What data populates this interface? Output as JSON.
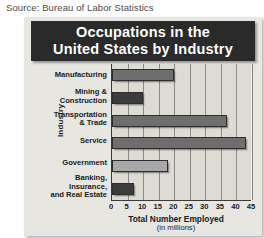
{
  "source_note": "Source: Bureau of Labor Statistics",
  "chart_data": {
    "type": "bar",
    "orientation": "horizontal",
    "title": "Occupations in the United States by Industry",
    "title_lines": [
      "Occupations in the",
      "United States by Industry"
    ],
    "xlabel": "Total Number Employed",
    "xlabel_sub": "(in millions)",
    "ylabel": "Industry",
    "categories": [
      "Manufacturing",
      "Mining & Construction",
      "Transportation & Trade",
      "Service",
      "Government",
      "Banking, Insurance, and Real Estate"
    ],
    "category_lines": [
      [
        "Manufacturing"
      ],
      [
        "Mining &",
        "Construction"
      ],
      [
        "Transportation",
        "& Trade"
      ],
      [
        "Service"
      ],
      [
        "Government"
      ],
      [
        "Banking,",
        "Insurance,",
        "and Real Estate"
      ]
    ],
    "values": [
      20,
      10,
      37,
      43,
      18,
      7
    ],
    "bar_colors": [
      "#6e6e6e",
      "#3c3c3c",
      "#6e6e6e",
      "#6e6e6e",
      "#a8a8a8",
      "#3c3c3c"
    ],
    "xlim": [
      0,
      45
    ],
    "xticks": [
      0,
      5,
      10,
      15,
      20,
      25,
      30,
      35,
      40,
      45
    ],
    "xtick_labels": [
      "0",
      "5",
      "10",
      "15",
      "20",
      "25",
      "30",
      "35",
      "40",
      "45"
    ],
    "grid": true,
    "legend": false
  },
  "colors": {
    "panel_bg": "#e8e6e1",
    "plot_bg": "#dedbd4",
    "banner_bg": "#2a2a2a",
    "banner_text": "#ffffff",
    "axis": "#3a3a3a",
    "gridline": "#8b8b86"
  }
}
